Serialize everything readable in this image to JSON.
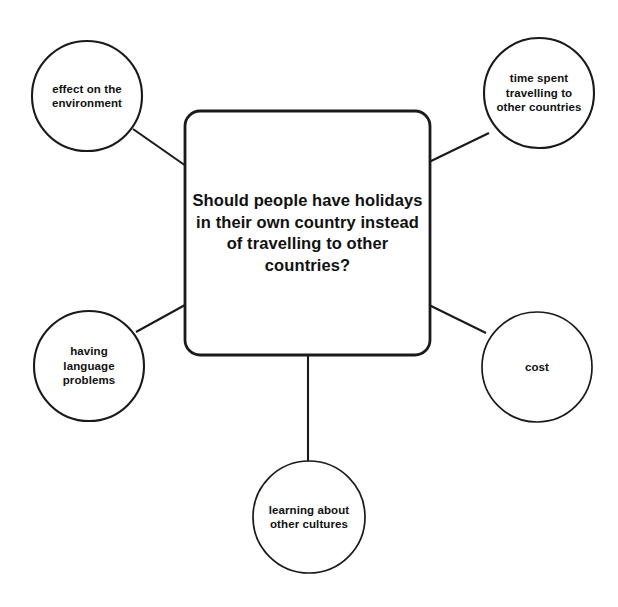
{
  "diagram": {
    "type": "mind-map",
    "title": "Should people have holidays in their own country instead of travelling to other countries?",
    "central_node": {
      "text": "Should people have holidays in their own country instead of travelling to other countries?",
      "shape": "rounded-rectangle"
    },
    "branches": [
      {
        "id": "effect-on-the-environment",
        "text": "effect on the\nenvironment",
        "shape": "circle",
        "position": "top-left"
      },
      {
        "id": "time-spent-travelling-to-other-countries",
        "text": "time spent\ntravelling to\nother countries",
        "shape": "circle",
        "position": "top-right"
      },
      {
        "id": "having-language-problems",
        "text": "having\nlanguage\nproblems",
        "shape": "circle",
        "position": "bottom-left"
      },
      {
        "id": "cost",
        "text": "cost",
        "shape": "circle",
        "position": "right"
      },
      {
        "id": "learning-about-other-cultures",
        "text": "learning about\nother cultures",
        "shape": "circle",
        "position": "bottom"
      }
    ],
    "colors": {
      "background": "#ffffff",
      "stroke": "#1a1a1a",
      "text": "#111111",
      "fill": "#ffffff"
    }
  }
}
